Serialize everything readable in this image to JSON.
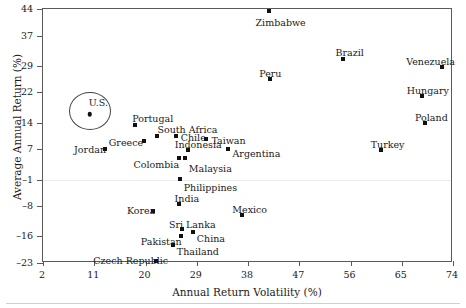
{
  "chart_data": {
    "type": "scatter",
    "title": "",
    "xlabel": "Annual Return Volatility (%)",
    "ylabel": "Average Annual Return (%)",
    "xlim": [
      2,
      74
    ],
    "ylim": [
      -23,
      44
    ],
    "xticks": [
      2,
      11,
      20,
      29,
      38,
      47,
      56,
      65,
      74
    ],
    "yticks": [
      -23,
      -16,
      -8,
      -1,
      7,
      14,
      22,
      29,
      37,
      44
    ],
    "grid": false,
    "legend": "none",
    "reference_line": {
      "y": -1,
      "style": "solid",
      "color": "#ececec"
    },
    "annotation": {
      "label": "U.S.",
      "shape": "ellipse",
      "target": "U.S."
    },
    "points": [
      {
        "label": "U.S.",
        "x": 10.2,
        "y": 16.2,
        "marker": "circle",
        "label_dx": -1,
        "label_dy": -16
      },
      {
        "label": "Jordan",
        "x": 12.9,
        "y": 7.1,
        "marker": "square",
        "label_dx": -31,
        "label_dy": -4
      },
      {
        "label": "Portugal",
        "x": 18.2,
        "y": 13.4,
        "marker": "square",
        "label_dx": -3,
        "label_dy": -11
      },
      {
        "label": "Greece",
        "x": 19.7,
        "y": 9.2,
        "marker": "square",
        "label_dx": -35,
        "label_dy": -3
      },
      {
        "label": "South Africa",
        "x": 22.1,
        "y": 10.6,
        "marker": "square",
        "label_dx": 0,
        "label_dy": -11
      },
      {
        "label": "Chile",
        "x": 25.3,
        "y": 10.4,
        "marker": "square",
        "label_dx": 5,
        "label_dy": -3
      },
      {
        "label": "Indonesia",
        "x": 27.4,
        "y": 6.7,
        "marker": "square",
        "label_dx": -13,
        "label_dy": -10
      },
      {
        "label": "Colombia",
        "x": 25.8,
        "y": 4.6,
        "marker": "square",
        "label_dx": -45,
        "label_dy": 2
      },
      {
        "label": "Malaysia",
        "x": 26.9,
        "y": 4.6,
        "marker": "square",
        "label_dx": 4,
        "label_dy": 6
      },
      {
        "label": "Taiwan",
        "x": 30.7,
        "y": 9.7,
        "marker": "square",
        "label_dx": 5,
        "label_dy": -3
      },
      {
        "label": "Argentina",
        "x": 34.4,
        "y": 7.2,
        "marker": "square",
        "label_dx": 5,
        "label_dy": 0
      },
      {
        "label": "Philippines",
        "x": 26.0,
        "y": -0.9,
        "marker": "square",
        "label_dx": 4,
        "label_dy": 4
      },
      {
        "label": "Korea",
        "x": 21.3,
        "y": -9.2,
        "marker": "square",
        "label_dx": -26,
        "label_dy": -5
      },
      {
        "label": "India",
        "x": 25.8,
        "y": -7.4,
        "marker": "square",
        "label_dx": -4,
        "label_dy": -10
      },
      {
        "label": "Sri Lanka",
        "x": 26.4,
        "y": -14.1,
        "marker": "square",
        "label_dx": -13,
        "label_dy": -9
      },
      {
        "label": "China",
        "x": 28.3,
        "y": -14.7,
        "marker": "square",
        "label_dx": 4,
        "label_dy": 2
      },
      {
        "label": "Pakistan",
        "x": 26.2,
        "y": -15.8,
        "marker": "square",
        "label_dx": -40,
        "label_dy": 1
      },
      {
        "label": "Thailand",
        "x": 24.8,
        "y": -18.3,
        "marker": "square",
        "label_dx": 4,
        "label_dy": 2
      },
      {
        "label": "Czech Republic",
        "x": 21.9,
        "y": -22.6,
        "marker": "square",
        "label_dx": -63,
        "label_dy": -5
      },
      {
        "label": "Mexico",
        "x": 37.0,
        "y": -10.3,
        "marker": "square",
        "label_dx": -10,
        "label_dy": -10
      },
      {
        "label": "Zimbabwe",
        "x": 41.6,
        "y": 43.5,
        "marker": "square",
        "label_dx": -13,
        "label_dy": 7
      },
      {
        "label": "Peru",
        "x": 41.9,
        "y": 25.5,
        "marker": "square",
        "label_dx": -11,
        "label_dy": -10
      },
      {
        "label": "Brazil",
        "x": 54.6,
        "y": 30.9,
        "marker": "square",
        "label_dx": -7,
        "label_dy": -11
      },
      {
        "label": "Turkey",
        "x": 61.3,
        "y": 6.9,
        "marker": "square",
        "label_dx": -10,
        "label_dy": -10
      },
      {
        "label": "Hungary",
        "x": 68.5,
        "y": 21.1,
        "marker": "square",
        "label_dx": -15,
        "label_dy": -10
      },
      {
        "label": "Poland",
        "x": 69.1,
        "y": 13.8,
        "marker": "square",
        "label_dx": -10,
        "label_dy": -10
      },
      {
        "label": "Venezuela",
        "x": 72.1,
        "y": 28.7,
        "marker": "square",
        "label_dx": -36,
        "label_dy": -10
      }
    ]
  },
  "axes": {
    "x_title": "Annual Return Volatility (%)",
    "y_title": "Average Annual Return (%)"
  }
}
